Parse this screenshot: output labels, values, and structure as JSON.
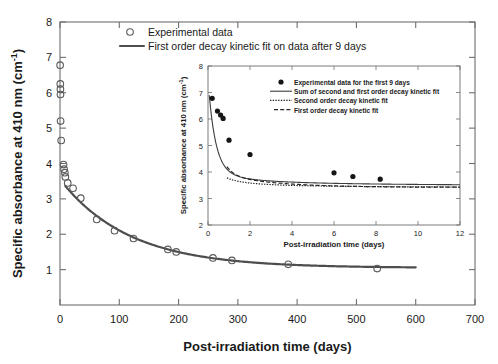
{
  "chart_data": {
    "type": "scatter",
    "title": "",
    "xlabel": "Post-irradiation time (days)",
    "ylabel": "Specific absorbance at 410 nm (cm-1)",
    "ylabel_main": "Specific absorbance at 410 nm (cm⁻¹)",
    "xlim": [
      0,
      700
    ],
    "ylim": [
      0,
      8
    ],
    "xticks": [
      0,
      100,
      200,
      300,
      400,
      500,
      600,
      700
    ],
    "yticks": [
      0,
      1,
      2,
      3,
      4,
      5,
      6,
      7,
      8
    ],
    "xticklabels": [
      "0",
      "100",
      "200",
      "300",
      "400",
      "500",
      "600",
      "700"
    ],
    "yticklabels": [
      "",
      "1",
      "2",
      "3",
      "4",
      "5",
      "6",
      "7",
      "8"
    ],
    "grid": false,
    "legend_position": "top-center",
    "legend": [
      {
        "label": "Experimental data",
        "marker": "open-circle"
      },
      {
        "label": "First order decay kinetic fit on data after 9 days",
        "marker": "solid-line"
      }
    ],
    "series": [
      {
        "name": "Experimental data",
        "marker": "open-circle",
        "points": [
          {
            "x": 0.2,
            "y": 6.78
          },
          {
            "x": 0.5,
            "y": 6.25
          },
          {
            "x": 0.7,
            "y": 6.1
          },
          {
            "x": 0.8,
            "y": 5.95
          },
          {
            "x": 1.0,
            "y": 5.2
          },
          {
            "x": 2.0,
            "y": 4.65
          },
          {
            "x": 6.0,
            "y": 3.97
          },
          {
            "x": 6.9,
            "y": 3.84
          },
          {
            "x": 8.2,
            "y": 3.74
          },
          {
            "x": 9.0,
            "y": 3.62
          },
          {
            "x": 13.0,
            "y": 3.45
          },
          {
            "x": 22.0,
            "y": 3.3
          },
          {
            "x": 35.0,
            "y": 3.02
          },
          {
            "x": 62.0,
            "y": 2.42
          },
          {
            "x": 92.0,
            "y": 2.1
          },
          {
            "x": 124.0,
            "y": 1.88
          },
          {
            "x": 182.0,
            "y": 1.57
          },
          {
            "x": 196.0,
            "y": 1.5
          },
          {
            "x": 258.0,
            "y": 1.33
          },
          {
            "x": 290.0,
            "y": 1.26
          },
          {
            "x": 385.0,
            "y": 1.15
          },
          {
            "x": 535.0,
            "y": 1.03
          }
        ]
      },
      {
        "name": "First order decay kinetic fit on data after 9 days",
        "type": "line",
        "style": "solid",
        "model": "A = A_inf + A0*exp(-k*t)",
        "params": {
          "A_inf": 1.05,
          "A0": 2.5,
          "k": 0.0086
        },
        "x_range": [
          9,
          600
        ]
      }
    ],
    "inset": {
      "type": "scatter",
      "xlabel": "Post-irradiation time (days)",
      "ylabel": "Specific absorbance at 410 nm (cm⁻¹)",
      "xlim": [
        0,
        12
      ],
      "ylim": [
        2,
        8
      ],
      "xticks": [
        0,
        2,
        4,
        6,
        8,
        10,
        12
      ],
      "yticks": [
        2,
        3,
        4,
        5,
        6,
        7,
        8
      ],
      "xticklabels": [
        "0",
        "2",
        "4",
        "6",
        "8",
        "10",
        "12"
      ],
      "yticklabels": [
        "2",
        "3",
        "4",
        "5",
        "6",
        "7",
        "8"
      ],
      "grid": false,
      "legend_position": "top-right",
      "legend": [
        {
          "label": "Experimental data for the first 9 days",
          "marker": "filled-circle"
        },
        {
          "label": "Sum of second and first order decay kinetic fit",
          "marker": "solid-line"
        },
        {
          "label": "Second order decay kinetic fit",
          "marker": "dotted-line"
        },
        {
          "label": "First order decay kinetic fit",
          "marker": "dashed-line"
        }
      ],
      "series": [
        {
          "name": "Experimental data for the first 9 days",
          "marker": "filled-circle",
          "points": [
            {
              "x": 0.2,
              "y": 6.78
            },
            {
              "x": 0.45,
              "y": 6.3
            },
            {
              "x": 0.6,
              "y": 6.15
            },
            {
              "x": 0.72,
              "y": 6.02
            },
            {
              "x": 1.0,
              "y": 5.2
            },
            {
              "x": 2.0,
              "y": 4.66
            },
            {
              "x": 6.0,
              "y": 3.97
            },
            {
              "x": 6.9,
              "y": 3.83
            },
            {
              "x": 8.2,
              "y": 3.73
            }
          ]
        },
        {
          "name": "Sum of second and first order decay kinetic fit",
          "type": "line",
          "style": "solid",
          "model": "sum-second-first-order"
        },
        {
          "name": "Second order decay kinetic fit",
          "type": "line",
          "style": "dotted",
          "model": "second-order"
        },
        {
          "name": "First order decay kinetic fit",
          "type": "line",
          "style": "dashed",
          "model": "first-order"
        }
      ]
    }
  }
}
